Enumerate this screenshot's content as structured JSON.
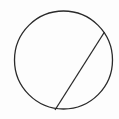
{
  "diagram": {
    "type": "circle-with-chord",
    "background": "#fdfdfd",
    "stroke_color": "#2a2a2a",
    "circle": {
      "cx": 63.5,
      "cy": 60,
      "r": 49
    },
    "chord": {
      "x1": 104.5,
      "y1": 32,
      "x2": 55,
      "y2": 110
    }
  }
}
